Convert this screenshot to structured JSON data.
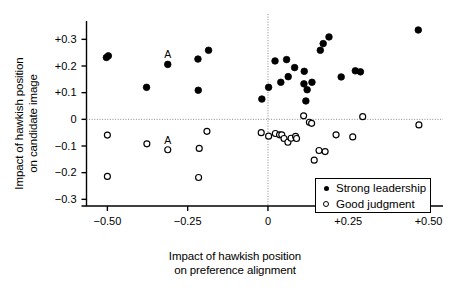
{
  "chart_data": {
    "type": "scatter",
    "title": "",
    "xlabel": "Impact of hawkish position\non preference alignment",
    "ylabel": "Impact of hawkish position\non candidate image",
    "xlim": [
      -0.565,
      0.545
    ],
    "ylim": [
      -0.325,
      0.365
    ],
    "xticks": [
      -0.5,
      -0.25,
      0,
      0.25,
      0.5
    ],
    "xtick_labels": [
      "−0.50",
      "−0.25",
      "0",
      "+0.25",
      "+0.50"
    ],
    "yticks": [
      0.3,
      0.2,
      0.1,
      0,
      -0.1,
      -0.2,
      -0.3
    ],
    "ytick_labels": [
      "+0.3",
      "+0.2",
      "+0.1",
      "0",
      "−0.1",
      "−0.2",
      "−0.3"
    ],
    "grid": false,
    "reference_lines": [
      {
        "axis": "y",
        "value": 0,
        "style": "dotted"
      },
      {
        "axis": "x",
        "value": 0,
        "style": "dotted"
      }
    ],
    "legend_position": "lower right",
    "series": [
      {
        "name": "Strong leadership",
        "marker": "filled-circle",
        "color": "#000000",
        "points": [
          {
            "x": -0.503,
            "y": 0.232
          },
          {
            "x": -0.497,
            "y": 0.238
          },
          {
            "x": -0.378,
            "y": 0.12
          },
          {
            "x": -0.312,
            "y": 0.206,
            "label": "A"
          },
          {
            "x": -0.218,
            "y": 0.226
          },
          {
            "x": -0.217,
            "y": 0.109
          },
          {
            "x": -0.185,
            "y": 0.259
          },
          {
            "x": -0.019,
            "y": 0.076
          },
          {
            "x": 0.002,
            "y": 0.12
          },
          {
            "x": 0.022,
            "y": 0.219
          },
          {
            "x": 0.04,
            "y": 0.139
          },
          {
            "x": 0.058,
            "y": 0.224
          },
          {
            "x": 0.063,
            "y": 0.16
          },
          {
            "x": 0.083,
            "y": 0.194
          },
          {
            "x": 0.112,
            "y": 0.133
          },
          {
            "x": 0.113,
            "y": 0.18
          },
          {
            "x": 0.118,
            "y": 0.069
          },
          {
            "x": 0.122,
            "y": 0.111
          },
          {
            "x": 0.137,
            "y": 0.139
          },
          {
            "x": 0.163,
            "y": 0.259
          },
          {
            "x": 0.172,
            "y": 0.284
          },
          {
            "x": 0.19,
            "y": 0.309
          },
          {
            "x": 0.228,
            "y": 0.159
          },
          {
            "x": 0.272,
            "y": 0.182
          },
          {
            "x": 0.288,
            "y": 0.178
          },
          {
            "x": 0.468,
            "y": 0.335
          }
        ]
      },
      {
        "name": "Good judgment",
        "marker": "open-circle",
        "color": "#000000",
        "points": [
          {
            "x": -0.5,
            "y": -0.059
          },
          {
            "x": -0.5,
            "y": -0.214
          },
          {
            "x": -0.377,
            "y": -0.092
          },
          {
            "x": -0.312,
            "y": -0.114,
            "label": "A"
          },
          {
            "x": -0.214,
            "y": -0.109
          },
          {
            "x": -0.216,
            "y": -0.218
          },
          {
            "x": -0.19,
            "y": -0.045
          },
          {
            "x": -0.021,
            "y": -0.05
          },
          {
            "x": 0.002,
            "y": -0.063
          },
          {
            "x": 0.023,
            "y": -0.053
          },
          {
            "x": 0.036,
            "y": -0.058
          },
          {
            "x": 0.043,
            "y": -0.058
          },
          {
            "x": 0.05,
            "y": -0.072
          },
          {
            "x": 0.062,
            "y": -0.086
          },
          {
            "x": 0.072,
            "y": -0.071
          },
          {
            "x": 0.086,
            "y": -0.064
          },
          {
            "x": 0.089,
            "y": -0.072
          },
          {
            "x": 0.111,
            "y": 0.013
          },
          {
            "x": 0.129,
            "y": -0.011
          },
          {
            "x": 0.136,
            "y": -0.015
          },
          {
            "x": 0.144,
            "y": -0.153
          },
          {
            "x": 0.159,
            "y": -0.117
          },
          {
            "x": 0.178,
            "y": -0.121
          },
          {
            "x": 0.212,
            "y": -0.058
          },
          {
            "x": 0.264,
            "y": -0.066
          },
          {
            "x": 0.295,
            "y": 0.01
          },
          {
            "x": 0.47,
            "y": -0.021
          }
        ]
      }
    ],
    "annotations": [
      {
        "text": "A",
        "x": -0.312,
        "y": 0.206,
        "series": "Strong leadership"
      },
      {
        "text": "A",
        "x": -0.312,
        "y": -0.114,
        "series": "Good judgment"
      }
    ]
  },
  "legend": {
    "items": [
      {
        "label": "Strong leadership",
        "marker": "filled-circle"
      },
      {
        "label": "Good judgment",
        "marker": "open-circle"
      }
    ]
  }
}
